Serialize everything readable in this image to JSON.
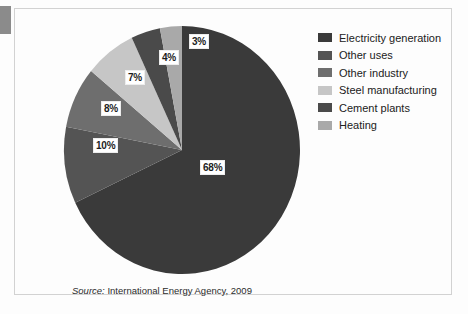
{
  "figure": {
    "source_prefix": "Source:",
    "source_text": "International Energy Agency, 2009"
  },
  "legend": {
    "items": [
      {
        "label": "Electricity generation",
        "color": "#3a3a3a",
        "swatch_name": "legend-swatch-electricity-generation"
      },
      {
        "label": "Other uses",
        "color": "#545454",
        "swatch_name": "legend-swatch-other-uses"
      },
      {
        "label": "Other industry",
        "color": "#6e6e6e",
        "swatch_name": "legend-swatch-other-industry"
      },
      {
        "label": "Steel manufacturing",
        "color": "#c6c6c6",
        "swatch_name": "legend-swatch-steel-manufacturing"
      },
      {
        "label": "Cement plants",
        "color": "#4a4a4a",
        "swatch_name": "legend-swatch-cement-plants"
      },
      {
        "label": "Heating",
        "color": "#a9a9a9",
        "swatch_name": "legend-swatch-heating"
      }
    ]
  },
  "chart_data": {
    "type": "pie",
    "title": "",
    "subtitle": "",
    "xlabel": "",
    "ylabel": "",
    "grid": false,
    "legend_position": "right",
    "units": "percent",
    "total": 100,
    "start_angle_deg": 0,
    "direction": "clockwise",
    "categories": [
      "Electricity generation",
      "Other uses",
      "Other industry",
      "Steel manufacturing",
      "Cement plants",
      "Heating"
    ],
    "values": [
      68,
      10,
      8,
      7,
      4,
      3
    ],
    "colors": [
      "#3a3a3a",
      "#545454",
      "#6e6e6e",
      "#c6c6c6",
      "#4a4a4a",
      "#a9a9a9"
    ],
    "slices": [
      {
        "label": "Electricity generation",
        "value": 68,
        "display": "68%",
        "color": "#3a3a3a"
      },
      {
        "label": "Other uses",
        "value": 10,
        "display": "10%",
        "color": "#545454"
      },
      {
        "label": "Other industry",
        "value": 8,
        "display": "8%",
        "color": "#6e6e6e"
      },
      {
        "label": "Steel manufacturing",
        "value": 7,
        "display": "7%",
        "color": "#c6c6c6"
      },
      {
        "label": "Cement plants",
        "value": 4,
        "display": "4%",
        "color": "#4a4a4a"
      },
      {
        "label": "Heating",
        "value": 3,
        "display": "3%",
        "color": "#a9a9a9"
      }
    ],
    "data_labels": [
      "68%",
      "10%",
      "8%",
      "7%",
      "4%",
      "3%"
    ],
    "annotations": [
      "Source: International Energy Agency, 2009"
    ]
  }
}
